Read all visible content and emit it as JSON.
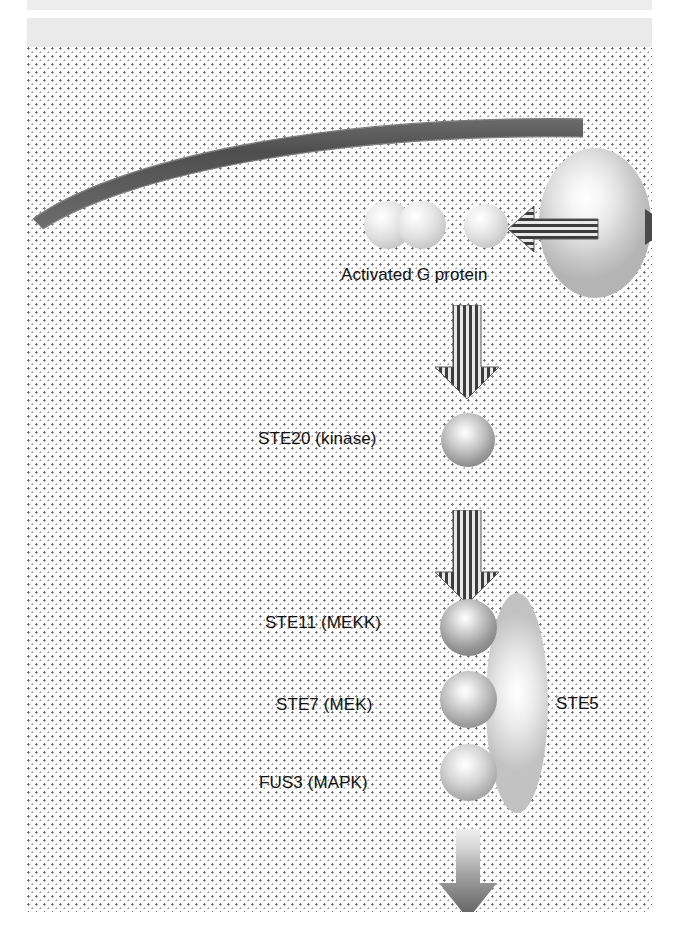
{
  "figure": {
    "width": 681,
    "height": 935
  },
  "labels": {
    "activated_g_protein": "Activated G protein",
    "ste20": "STE20 (kinase)",
    "ste11": "STE11 (MEKK)",
    "ste7": "STE7 (MEK)",
    "fus3": "FUS3 (MAPK)",
    "ste5": "STE5"
  },
  "components": {
    "membrane": "plasma-membrane",
    "receptor": "receptor-ellipse",
    "g_protein_subunits": [
      "g-beta-subunit",
      "g-gamma-subunit",
      "g-alpha-subunit"
    ],
    "kinases": [
      "ste20-sphere",
      "ste11-sphere",
      "ste7-sphere",
      "fus3-sphere"
    ],
    "scaffold": "ste5-scaffold"
  },
  "arrows": {
    "activation_down_1": "striped-down-arrow",
    "activation_down_2": "striped-down-arrow",
    "output_down": "gradient-down-arrow",
    "ligand_inward": "striped-left-arrow",
    "receptor_tail": "small-arrowhead"
  },
  "colors": {
    "membrane": "#5a5a5a",
    "cytoplasm_dot": "#6f6f6f",
    "band": "#eaeaea",
    "label_text": "#111111",
    "arrow_stripe_dark": "#3c3c3c",
    "arrow_stripe_light": "#e8e8e8"
  }
}
